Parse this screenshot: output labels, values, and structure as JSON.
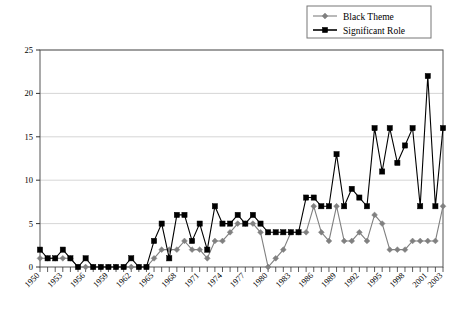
{
  "chart_data": {
    "type": "line",
    "title": "",
    "xlabel": "",
    "ylabel": "",
    "ylim": [
      0,
      25
    ],
    "ytick_step": 5,
    "yticks": [
      0,
      5,
      10,
      15,
      20,
      25
    ],
    "xlim": [
      1950,
      2003
    ],
    "xtick_labels": [
      "1950",
      "1953",
      "1956",
      "1959",
      "1962",
      "1965",
      "1968",
      "1971",
      "1974",
      "1977",
      "1980",
      "1983",
      "1986",
      "1989",
      "1992",
      "1995",
      "1998",
      "2001",
      "2003"
    ],
    "xtick_label_step": 3,
    "grid": "horizontal",
    "legend_position": "top-right",
    "x": [
      1950,
      1951,
      1952,
      1953,
      1954,
      1955,
      1956,
      1957,
      1958,
      1959,
      1960,
      1961,
      1962,
      1963,
      1964,
      1965,
      1966,
      1967,
      1968,
      1969,
      1970,
      1971,
      1972,
      1973,
      1974,
      1975,
      1976,
      1977,
      1978,
      1979,
      1980,
      1981,
      1982,
      1983,
      1984,
      1985,
      1986,
      1987,
      1988,
      1989,
      1990,
      1991,
      1992,
      1993,
      1994,
      1995,
      1996,
      1997,
      1998,
      1999,
      2000,
      2001,
      2002,
      2003
    ],
    "series": [
      {
        "name": "Black Theme",
        "color": "#808080",
        "marker": "diamond",
        "values": [
          1,
          1,
          1,
          1,
          1,
          0,
          0,
          0,
          0,
          0,
          0,
          0,
          0,
          0,
          0,
          1,
          2,
          2,
          2,
          3,
          2,
          2,
          1,
          3,
          3,
          4,
          5,
          5,
          5,
          4,
          0,
          1,
          2,
          4,
          4,
          4,
          7,
          4,
          3,
          7,
          3,
          3,
          4,
          3,
          6,
          5,
          2,
          2,
          2,
          3,
          3,
          3,
          3,
          7
        ]
      },
      {
        "name": "Significant Role",
        "color": "#000000",
        "marker": "square",
        "values": [
          2,
          1,
          1,
          2,
          1,
          0,
          1,
          0,
          0,
          0,
          0,
          0,
          1,
          0,
          0,
          3,
          5,
          1,
          6,
          6,
          3,
          5,
          2,
          7,
          5,
          5,
          6,
          5,
          6,
          5,
          4,
          4,
          4,
          4,
          4,
          8,
          8,
          7,
          7,
          13,
          7,
          9,
          8,
          7,
          16,
          11,
          16,
          12,
          14,
          16,
          7,
          22,
          7,
          16
        ]
      }
    ],
    "legend": [
      {
        "label": "Black Theme",
        "color": "#808080",
        "marker": "diamond"
      },
      {
        "label": "Significant Role",
        "color": "#000000",
        "marker": "square"
      }
    ]
  }
}
